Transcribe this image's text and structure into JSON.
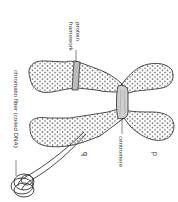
{
  "diagram": {
    "labels": {
      "protein_framework_line1": "protein",
      "protein_framework_line2": "framework",
      "chromatin_fiber": "chromatin fiber (coiled DNA)",
      "centromere": "centromere",
      "p_arm": "p",
      "q_arm": "q"
    },
    "parts": [
      "chromatid-upper-left",
      "chromatid-upper-right",
      "chromatid-lower-left",
      "chromatid-lower-right",
      "centromere",
      "protein-framework",
      "chromatin-fiber-coil"
    ],
    "colors": {
      "outline": "#222222",
      "fill": "#ffffff",
      "centromere": "#cfcfcf",
      "framework": "#bbbbbb",
      "text": "#333333"
    }
  }
}
